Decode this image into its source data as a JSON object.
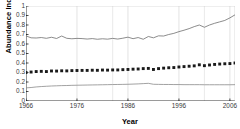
{
  "chart_data": {
    "type": "line",
    "title": "",
    "xlabel": "Year",
    "ylabel": "Abundance Index",
    "xlim": [
      1966,
      2007
    ],
    "ylim": [
      0,
      1
    ],
    "ytick_labels": [
      "1",
      "0.9",
      "0.8",
      "0.7",
      "0.6",
      "0.5",
      "0.4",
      "0.3",
      "0.2",
      "0.1",
      "0"
    ],
    "ytick_values": [
      1,
      0.9,
      0.8,
      0.7,
      0.6,
      0.5,
      0.4,
      0.3,
      0.2,
      0.1,
      0
    ],
    "xtick_labels": [
      "1966",
      "1976",
      "1986",
      "1996",
      "2006"
    ],
    "xtick_values": [
      1966,
      1976,
      1986,
      1996,
      2006
    ],
    "grid": "vertical-only",
    "legend": "none",
    "x": [
      1966,
      1967,
      1968,
      1969,
      1970,
      1971,
      1972,
      1973,
      1974,
      1975,
      1976,
      1977,
      1978,
      1979,
      1980,
      1981,
      1982,
      1983,
      1984,
      1985,
      1986,
      1987,
      1988,
      1989,
      1990,
      1991,
      1992,
      1993,
      1994,
      1995,
      1996,
      1997,
      1998,
      1999,
      2000,
      2001,
      2002,
      2003,
      2004,
      2005,
      2006,
      2007
    ],
    "series": [
      {
        "name": "upper-line",
        "style": "line",
        "color": "#6e6e6e",
        "values": [
          0.685,
          0.665,
          0.663,
          0.668,
          0.66,
          0.671,
          0.658,
          0.684,
          0.66,
          0.655,
          0.659,
          0.657,
          0.652,
          0.657,
          0.65,
          0.655,
          0.651,
          0.659,
          0.652,
          0.661,
          0.672,
          0.656,
          0.668,
          0.65,
          0.679,
          0.665,
          0.686,
          0.684,
          0.7,
          0.712,
          0.73,
          0.745,
          0.762,
          0.783,
          0.8,
          0.776,
          0.8,
          0.818,
          0.833,
          0.848,
          0.875,
          0.907
        ]
      },
      {
        "name": "middle-marker-series",
        "style": "markers",
        "marker": "square",
        "color": "#1a1a1a",
        "values": [
          0.3,
          0.305,
          0.31,
          0.312,
          0.31,
          0.316,
          0.315,
          0.318,
          0.317,
          0.32,
          0.321,
          0.322,
          0.322,
          0.324,
          0.323,
          0.326,
          0.325,
          0.327,
          0.327,
          0.33,
          0.332,
          0.335,
          0.337,
          0.341,
          0.343,
          0.332,
          0.341,
          0.346,
          0.35,
          0.352,
          0.358,
          0.362,
          0.366,
          0.37,
          0.381,
          0.372,
          0.379,
          0.385,
          0.389,
          0.392,
          0.394,
          0.4
        ]
      },
      {
        "name": "lower-line",
        "style": "line",
        "color": "#8a8a8a",
        "values": [
          0.138,
          0.142,
          0.148,
          0.152,
          0.155,
          0.158,
          0.16,
          0.162,
          0.163,
          0.165,
          0.166,
          0.167,
          0.168,
          0.169,
          0.17,
          0.171,
          0.172,
          0.173,
          0.174,
          0.175,
          0.176,
          0.178,
          0.18,
          0.183,
          0.186,
          0.176,
          0.175,
          0.174,
          0.174,
          0.173,
          0.173,
          0.172,
          0.172,
          0.172,
          0.172,
          0.171,
          0.171,
          0.171,
          0.171,
          0.171,
          0.171,
          0.172
        ]
      }
    ]
  }
}
